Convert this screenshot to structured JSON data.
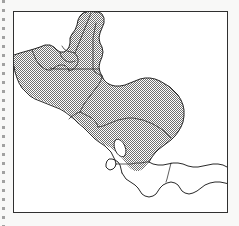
{
  "figure": {
    "kind": "map-figure",
    "width": 239,
    "height": 226,
    "background_color": "#f8f8f7",
    "scan_artifact": {
      "name": "page-edge-dotted-line",
      "visible": true,
      "side": "left"
    }
  },
  "frame": {
    "name": "map-border",
    "x": 13,
    "y": 11,
    "width": 215,
    "height": 202,
    "stroke_color": "#303030",
    "fill_color": "#ffffff"
  },
  "legend": {
    "shaded_meaning": "highlighted region",
    "unshaded_meaning": "not highlighted",
    "shaded_fill_color": "#9a9a9a",
    "shaded_pattern": "50% checkerboard dither",
    "unshaded_fill_color": "#ffffff",
    "coastline_color": "#1d1d1d",
    "internal_border_color": "#2a2a2a"
  },
  "map": {
    "region_title": "Central America",
    "projection_note": "",
    "shaded_countries": [
      "Mexico (southern states)",
      "Belize",
      "Guatemala",
      "El Salvador",
      "Honduras",
      "Nicaragua"
    ],
    "unshaded_countries": [
      "Costa Rica",
      "Panama"
    ],
    "water_features": [
      "Lake Nicaragua"
    ],
    "seas": [
      "Gulf of Mexico",
      "Caribbean Sea",
      "Pacific Ocean"
    ]
  },
  "shapes": {
    "mainland_outline": "M 0,128 L 0,41 L 18,36 L 30,33 L 39,34 L 46,33 L 52,35 L 57,36 L 62,34 L 66,30 L 69,24 L 72,16 L 74,9 L 77,3 L 80,0 L 92,0 L 100,0 L 104,3 L 106,8 L 108,14 L 106,20 L 103,26 L 101,33 L 100,40 L 102,47 L 105,53 L 106,60 L 104,66 L 101,72 L 100,79 L 103,84 L 108,87 L 114,88 L 121,86 L 128,83 L 135,80 L 142,78 L 149,78 L 156,80 L 162,83 L 168,87 L 173,92 L 177,98 L 180,105 L 181,112 L 180,119 L 177,125 L 173,130 L 168,134 L 162,137 L 156,140 L 150,144 L 145,149 L 141,155 L 137,161 L 132,165 L 126,167 L 120,167 L 114,165 L 109,161 L 105,156 L 101,151 L 97,146 L 93,142 L 88,139 L 83,137 L 78,135 L 73,132 L 68,129 L 63,125 L 58,120 L 53,115 L 48,110 L 43,105 L 38,101 L 33,98 L 28,95 L 23,92 L 18,89 L 13,85 L 9,80 L 6,74 L 4,68 L 3,61 L 2,54 L 1,47 Z",
    "lake_nicaragua": "M 118,147 a 7,12 -22 1,0 0.1,0 Z"
  },
  "labels": []
}
